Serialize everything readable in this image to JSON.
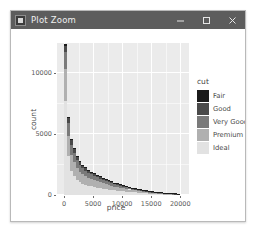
{
  "window": {
    "title": "Plot Zoom",
    "icon": "plot-window-icon",
    "controls": [
      {
        "name": "minimize-button",
        "glyph": "minimize-icon"
      },
      {
        "name": "maximize-button",
        "glyph": "maximize-icon"
      },
      {
        "name": "close-button",
        "glyph": "close-icon"
      }
    ]
  },
  "legend": {
    "title": "cut",
    "items": [
      {
        "label": "Fair",
        "color": "#1b1b1b"
      },
      {
        "label": "Good",
        "color": "#4a4a4a"
      },
      {
        "label": "Very Good",
        "color": "#7a7a7a"
      },
      {
        "label": "Premium",
        "color": "#b0b0b0"
      },
      {
        "label": "Ideal",
        "color": "#e2e2e2"
      }
    ]
  },
  "theme": {
    "panel_background": "#ebebeb",
    "grid_color": "#ffffff",
    "plot_background": "#ffffff",
    "titlebar_background": "#5d5d5d",
    "axis_text_color": "#5a5a5a"
  },
  "chart_data": {
    "type": "bar",
    "title": "",
    "xlabel": "price",
    "ylabel": "count",
    "xlim": [
      -1200,
      21500
    ],
    "ylim": [
      0,
      12500
    ],
    "xticks": [
      0,
      5000,
      10000,
      15000,
      20000
    ],
    "yticks": [
      0,
      5000,
      10000
    ],
    "xtick_labels": [
      "0",
      "5000",
      "10000",
      "15000",
      "20000"
    ],
    "ytick_labels": [
      "0",
      "5000",
      "10000"
    ],
    "grid": true,
    "stacked": true,
    "legend_title": "cut",
    "legend_position": "right",
    "bin_width": 500,
    "bin_centers": [
      250,
      750,
      1250,
      1750,
      2250,
      2750,
      3250,
      3750,
      4250,
      4750,
      5250,
      5750,
      6250,
      6750,
      7250,
      7750,
      8250,
      8750,
      9250,
      9750,
      10250,
      10750,
      11250,
      11750,
      12250,
      12750,
      13250,
      13750,
      14250,
      14750,
      15250,
      15750,
      16250,
      16750,
      17250,
      17750,
      18250,
      18750,
      19250,
      19750
    ],
    "series": [
      {
        "name": "Fair",
        "color": "#1b1b1b",
        "values": [
          120,
          80,
          95,
          90,
          70,
          65,
          60,
          58,
          55,
          50,
          48,
          45,
          42,
          40,
          38,
          36,
          34,
          30,
          28,
          26,
          24,
          22,
          20,
          18,
          16,
          15,
          14,
          12,
          11,
          10,
          9,
          8,
          7,
          6,
          5,
          5,
          4,
          4,
          3,
          3
        ]
      },
      {
        "name": "Good",
        "color": "#4a4a4a",
        "values": [
          530,
          420,
          360,
          330,
          280,
          250,
          220,
          200,
          185,
          170,
          155,
          145,
          135,
          125,
          115,
          105,
          95,
          88,
          80,
          74,
          68,
          62,
          56,
          50,
          45,
          41,
          37,
          33,
          29,
          26,
          23,
          20,
          18,
          16,
          14,
          12,
          10,
          9,
          8,
          7
        ]
      },
      {
        "name": "Very Good",
        "color": "#7a7a7a",
        "values": [
          1380,
          1020,
          860,
          780,
          650,
          580,
          520,
          470,
          430,
          400,
          370,
          345,
          320,
          295,
          272,
          250,
          230,
          210,
          192,
          176,
          160,
          146,
          132,
          120,
          108,
          97,
          87,
          78,
          70,
          62,
          55,
          49,
          43,
          38,
          33,
          29,
          25,
          22,
          19,
          16
        ]
      },
      {
        "name": "Premium",
        "color": "#b0b0b0",
        "values": [
          2600,
          1700,
          1320,
          1150,
          960,
          840,
          760,
          690,
          630,
          580,
          540,
          500,
          465,
          430,
          400,
          370,
          342,
          316,
          292,
          268,
          246,
          225,
          205,
          187,
          170,
          154,
          139,
          125,
          112,
          100,
          89,
          79,
          70,
          62,
          54,
          47,
          41,
          36,
          31,
          27
        ]
      },
      {
        "name": "Ideal",
        "color": "#e2e2e2",
        "values": [
          7770,
          3180,
          1965,
          1550,
          1240,
          1065,
          940,
          852,
          780,
          710,
          657,
          615,
          568,
          525,
          485,
          449,
          414,
          381,
          352,
          324,
          298,
          273,
          249,
          227,
          207,
          188,
          170,
          153,
          138,
          124,
          111,
          99,
          88,
          78,
          69,
          61,
          53,
          46,
          40,
          35
        ]
      }
    ]
  }
}
